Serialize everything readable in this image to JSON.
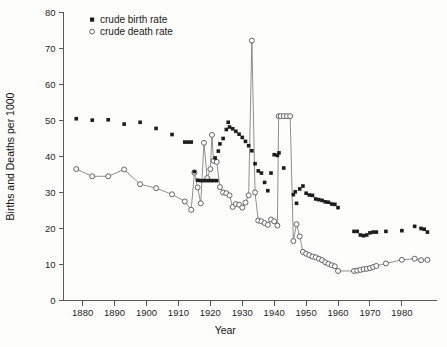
{
  "chart_data": {
    "type": "scatter",
    "title": "",
    "xlabel": "Year",
    "ylabel": "Births and Deaths per 1000",
    "xlim": [
      1874,
      1991
    ],
    "ylim": [
      0,
      80
    ],
    "xticks": [
      1880,
      1890,
      1900,
      1910,
      1920,
      1930,
      1940,
      1950,
      1960,
      1970,
      1980
    ],
    "yticks": [
      0,
      10,
      20,
      30,
      40,
      50,
      60,
      70,
      80
    ],
    "grid": false,
    "legend_position": "top-left",
    "series": [
      {
        "name": "crude birth rate",
        "marker": "filled-square",
        "color": "#1c1c1c",
        "connected": false,
        "points": [
          [
            1878,
            50.5
          ],
          [
            1883,
            50.1
          ],
          [
            1888,
            50.2
          ],
          [
            1893,
            49.0
          ],
          [
            1898,
            49.5
          ],
          [
            1903,
            47.8
          ],
          [
            1908,
            46.1
          ],
          [
            1912,
            44.0
          ],
          [
            1913,
            44.0
          ],
          [
            1914,
            44.0
          ],
          [
            1915,
            35.8
          ],
          [
            1916,
            33.4
          ],
          [
            1917,
            33.3
          ],
          [
            1918,
            33.3
          ],
          [
            1919,
            33.3
          ],
          [
            1920,
            33.3
          ],
          [
            1921,
            33.3
          ],
          [
            1922,
            33.3
          ],
          [
            1921.5,
            39.6
          ],
          [
            1922.5,
            41.5
          ],
          [
            1923,
            43.5
          ],
          [
            1924,
            45.0
          ],
          [
            1925,
            47.5
          ],
          [
            1925.6,
            49.5
          ],
          [
            1926,
            48.2
          ],
          [
            1927,
            47.7
          ],
          [
            1928,
            47.0
          ],
          [
            1929,
            46.2
          ],
          [
            1930,
            45.3
          ],
          [
            1931,
            44.2
          ],
          [
            1932,
            43.0
          ],
          [
            1933,
            41.6
          ],
          [
            1934,
            38.0
          ],
          [
            1935,
            36.0
          ],
          [
            1936,
            35.4
          ],
          [
            1937,
            32.8
          ],
          [
            1938,
            30.5
          ],
          [
            1939,
            35.4
          ],
          [
            1940,
            40.5
          ],
          [
            1941,
            40.3
          ],
          [
            1941.5,
            41.0
          ],
          [
            1943,
            36.8
          ],
          [
            1946,
            29.4
          ],
          [
            1946.6,
            30.2
          ],
          [
            1947,
            27.0
          ],
          [
            1948,
            31.0
          ],
          [
            1949,
            31.8
          ],
          [
            1950,
            29.8
          ],
          [
            1951,
            29.3
          ],
          [
            1952,
            29.2
          ],
          [
            1953,
            28.2
          ],
          [
            1954,
            28.0
          ],
          [
            1955,
            27.8
          ],
          [
            1956,
            27.4
          ],
          [
            1957,
            27.3
          ],
          [
            1958,
            26.8
          ],
          [
            1959,
            26.7
          ],
          [
            1960,
            25.8
          ],
          [
            1965,
            19.2
          ],
          [
            1966,
            19.2
          ],
          [
            1967,
            18.2
          ],
          [
            1968,
            18.0
          ],
          [
            1969,
            18.2
          ],
          [
            1970,
            18.8
          ],
          [
            1971,
            19.0
          ],
          [
            1972,
            19.0
          ],
          [
            1975,
            19.2
          ],
          [
            1980,
            19.4
          ],
          [
            1984,
            20.6
          ],
          [
            1986,
            20.0
          ],
          [
            1987,
            19.8
          ],
          [
            1988,
            19.0
          ]
        ]
      },
      {
        "name": "crude death rate",
        "marker": "open-circle",
        "color": "#4a4a4a",
        "connected": true,
        "points": [
          [
            1878,
            36.5
          ],
          [
            1883,
            34.5
          ],
          [
            1888,
            34.5
          ],
          [
            1893,
            36.4
          ],
          [
            1898,
            32.3
          ],
          [
            1903,
            31.2
          ],
          [
            1908,
            29.5
          ],
          [
            1912,
            27.5
          ],
          [
            1914,
            25.2
          ],
          [
            1915,
            35.5
          ],
          [
            1916,
            31.4
          ],
          [
            1917,
            27.0
          ],
          [
            1918,
            43.8
          ],
          [
            1919,
            34.0
          ],
          [
            1920,
            36.5
          ],
          [
            1920.5,
            46.0
          ],
          [
            1921,
            38.8
          ],
          [
            1922,
            38.5
          ],
          [
            1923,
            31.5
          ],
          [
            1924,
            30.0
          ],
          [
            1925,
            29.8
          ],
          [
            1926,
            29.2
          ],
          [
            1927,
            26.0
          ],
          [
            1928,
            26.8
          ],
          [
            1929,
            26.6
          ],
          [
            1930,
            25.8
          ],
          [
            1931,
            27.2
          ],
          [
            1932,
            29.2
          ],
          [
            1933,
            72.2
          ],
          [
            1934,
            30.0
          ],
          [
            1935,
            22.2
          ],
          [
            1936,
            22.0
          ],
          [
            1937,
            21.5
          ],
          [
            1938,
            21.0
          ],
          [
            1939,
            22.5
          ],
          [
            1940,
            22.0
          ],
          [
            1941,
            20.8
          ],
          [
            1941.4,
            51.2
          ],
          [
            1942,
            51.2
          ],
          [
            1943,
            51.2
          ],
          [
            1944,
            51.2
          ],
          [
            1945,
            51.2
          ],
          [
            1946,
            16.5
          ],
          [
            1947,
            21.2
          ],
          [
            1948,
            17.8
          ],
          [
            1949,
            13.5
          ],
          [
            1950,
            13.0
          ],
          [
            1951,
            12.6
          ],
          [
            1952,
            12.2
          ],
          [
            1953,
            12.0
          ],
          [
            1954,
            11.6
          ],
          [
            1955,
            11.2
          ],
          [
            1956,
            10.6
          ],
          [
            1957,
            10.2
          ],
          [
            1958,
            9.8
          ],
          [
            1959,
            9.5
          ],
          [
            1960,
            8.2
          ],
          [
            1965,
            8.2
          ],
          [
            1966,
            8.3
          ],
          [
            1967,
            8.5
          ],
          [
            1968,
            8.7
          ],
          [
            1969,
            8.8
          ],
          [
            1970,
            9.0
          ],
          [
            1971,
            9.3
          ],
          [
            1972,
            9.6
          ],
          [
            1975,
            10.3
          ],
          [
            1980,
            11.3
          ],
          [
            1984,
            11.6
          ],
          [
            1986,
            11.2
          ],
          [
            1988,
            11.3
          ]
        ]
      }
    ]
  },
  "legend": {
    "items": [
      {
        "label": "crude birth rate",
        "marker": "filled-square"
      },
      {
        "label": "crude death rate",
        "marker": "open-circle"
      }
    ]
  },
  "axes": {
    "x_title": "Year",
    "y_title": "Births and Deaths per 1000"
  }
}
